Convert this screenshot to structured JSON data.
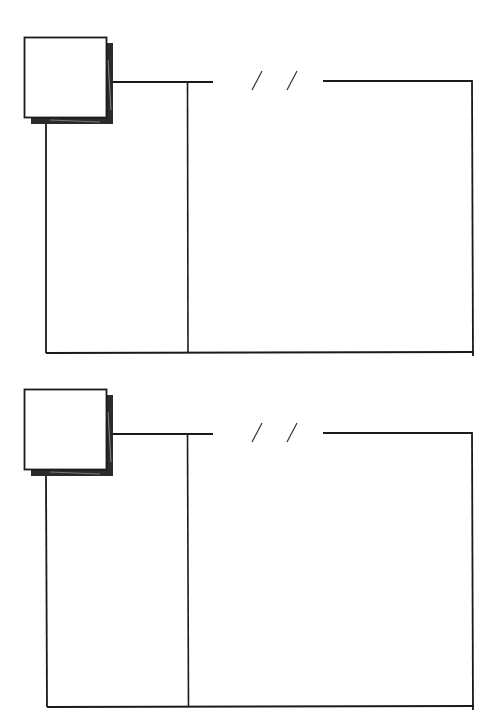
{
  "page": {
    "title": "",
    "background": "#ffffff",
    "ink_color": "#1a1a1a"
  },
  "panels": [
    {
      "id": "entry-1",
      "date_placeholder": "/ /",
      "photo_box": "empty",
      "left_column": "",
      "notes": ""
    },
    {
      "id": "entry-2",
      "date_placeholder": "/ /",
      "photo_box": "empty",
      "left_column": "",
      "notes": ""
    }
  ]
}
